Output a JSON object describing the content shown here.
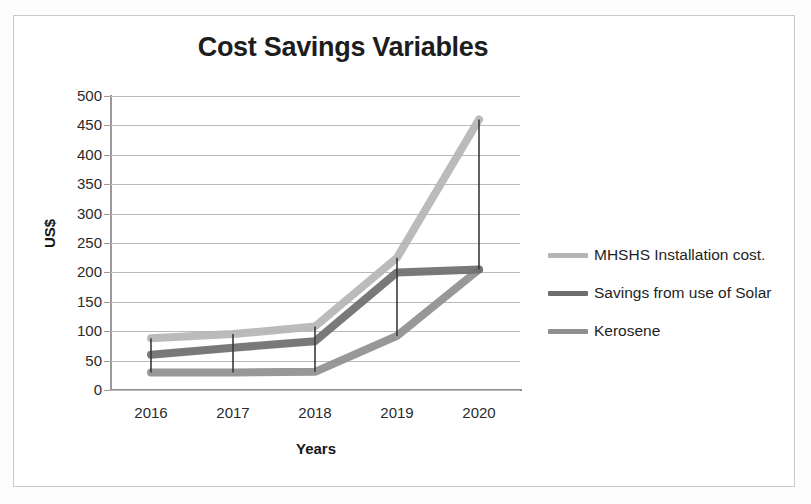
{
  "chart_data": {
    "type": "line",
    "title": "Cost Savings Variables",
    "xlabel": "Years",
    "ylabel": "US$",
    "categories": [
      "2016",
      "2017",
      "2018",
      "2019",
      "2020"
    ],
    "ylim": [
      0,
      500
    ],
    "ytick_labels": [
      "500",
      "450",
      "400",
      "350",
      "300",
      "250",
      "200",
      "150",
      "100",
      "50",
      "0"
    ],
    "ytick_values": [
      500,
      450,
      400,
      350,
      300,
      250,
      200,
      150,
      100,
      50,
      0
    ],
    "ytick_step": 50,
    "grid": true,
    "legend_position": "right",
    "drop_lines": true,
    "series": [
      {
        "name": "MHSHS Installation cost.",
        "color": "#b5b5b5",
        "values": [
          88,
          95,
          108,
          225,
          460
        ]
      },
      {
        "name": "Savings from use of Solar",
        "color": "#6e6e6e",
        "values": [
          60,
          72,
          83,
          200,
          205
        ]
      },
      {
        "name": "Kerosene",
        "color": "#8f8f8f",
        "values": [
          30,
          30,
          31,
          92,
          205
        ]
      }
    ]
  },
  "colors": {
    "page_border": "#c9c9c9",
    "gridline": "#b9b9b9",
    "axis": "#8d8d8d",
    "title_text": "#1d1d1d",
    "tick_text": "#2b2b2b",
    "drop_line": "#3a3a3a"
  }
}
